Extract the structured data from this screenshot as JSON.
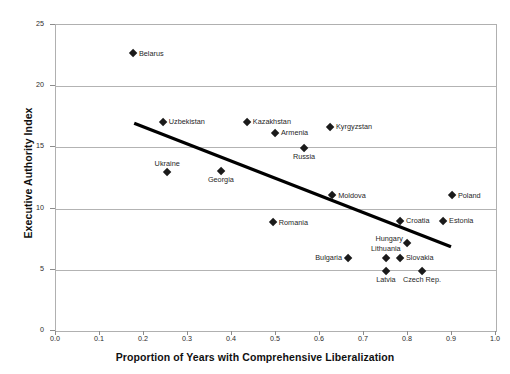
{
  "chart_data": {
    "type": "scatter",
    "title": "",
    "xlabel": "Proportion of Years with Comprehensive Liberalization",
    "ylabel": "Executive Authority Index",
    "xlim": [
      0.0,
      1.0
    ],
    "ylim": [
      0,
      25
    ],
    "xticks": [
      "0.0",
      "0.1",
      "0.2",
      "0.3",
      "0.4",
      "0.5",
      "0.6",
      "0.7",
      "0.8",
      "0.9",
      "1.0"
    ],
    "yticks": [
      "0",
      "5",
      "10",
      "15",
      "20",
      "25"
    ],
    "grid": "horizontal",
    "legend": "none",
    "marker_shape": "diamond",
    "marker_color": "#1a1a1a",
    "trendline": {
      "type": "linear",
      "x0": 0.18,
      "y0": 16.9,
      "x1": 0.9,
      "y1": 6.8,
      "color": "#000000"
    },
    "points": [
      {
        "label": "Belarus",
        "x": 0.177,
        "y": 22.6,
        "label_pos": "right"
      },
      {
        "label": "Uzbekistan",
        "x": 0.245,
        "y": 17.0,
        "label_pos": "right"
      },
      {
        "label": "Kazakhstan",
        "x": 0.436,
        "y": 17.0,
        "label_pos": "right"
      },
      {
        "label": "Armenia",
        "x": 0.5,
        "y": 16.1,
        "label_pos": "right"
      },
      {
        "label": "Kyrgyzstan",
        "x": 0.625,
        "y": 16.6,
        "label_pos": "right"
      },
      {
        "label": "Russia",
        "x": 0.566,
        "y": 14.9,
        "label_pos": "below"
      },
      {
        "label": "Ukraine",
        "x": 0.255,
        "y": 12.9,
        "label_pos": "above"
      },
      {
        "label": "Georgia",
        "x": 0.377,
        "y": 13.0,
        "label_pos": "below"
      },
      {
        "label": "Moldova",
        "x": 0.63,
        "y": 11.0,
        "label_pos": "right"
      },
      {
        "label": "Poland",
        "x": 0.902,
        "y": 11.0,
        "label_pos": "right"
      },
      {
        "label": "Romania",
        "x": 0.495,
        "y": 8.8,
        "label_pos": "right"
      },
      {
        "label": "Croatia",
        "x": 0.784,
        "y": 8.9,
        "label_pos": "right"
      },
      {
        "label": "Estonia",
        "x": 0.882,
        "y": 8.9,
        "label_pos": "right"
      },
      {
        "label": "Hungary",
        "x": 0.8,
        "y": 7.1,
        "label_pos": "upleft"
      },
      {
        "label": "Bulgaria",
        "x": 0.666,
        "y": 5.9,
        "label_pos": "left"
      },
      {
        "label": "Lithuania",
        "x": 0.752,
        "y": 5.9,
        "label_pos": "above"
      },
      {
        "label": "Slovakia",
        "x": 0.784,
        "y": 5.9,
        "label_pos": "right"
      },
      {
        "label": "Latvia",
        "x": 0.752,
        "y": 4.8,
        "label_pos": "below"
      },
      {
        "label": "Czech Rep.",
        "x": 0.834,
        "y": 4.8,
        "label_pos": "below"
      }
    ]
  }
}
